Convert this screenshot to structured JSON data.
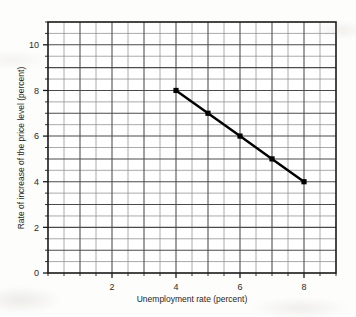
{
  "chart_data": {
    "type": "line",
    "title": "",
    "subtitle": "",
    "xlabel": "Unemployment rate (percent)",
    "ylabel": "Rate of increase of the price level (percent)",
    "xlim": [
      0,
      9
    ],
    "ylim": [
      0,
      11
    ],
    "x": [
      4,
      5,
      6,
      7,
      8
    ],
    "values": [
      8,
      7,
      6,
      5,
      4
    ],
    "series": [
      {
        "name": "Phillips curve",
        "x": [
          4,
          5,
          6,
          7,
          8
        ],
        "values": [
          8,
          7,
          6,
          5,
          4
        ]
      }
    ],
    "xticks": [
      2,
      4,
      6,
      8
    ],
    "xtick_labels": [
      "2",
      "4",
      "6",
      "8"
    ],
    "yticks": [
      0,
      2,
      4,
      6,
      8,
      10
    ],
    "ytick_labels": [
      "0",
      "2",
      "4",
      "6",
      "8",
      "10"
    ],
    "x_minor_step": 0.5,
    "y_minor_step": 0.5,
    "grid": true,
    "grid_minor": true,
    "legend": "none",
    "marker": "square",
    "line_color": "#000000",
    "grid_color": "#555555",
    "frame_color": "#1a1a1a",
    "background_color": "#fdfdfb",
    "annotations": []
  },
  "figure": {
    "x_axis_label": "Unemployment rate (percent)",
    "y_axis_label": "Rate of increase of the price level (percent)"
  }
}
